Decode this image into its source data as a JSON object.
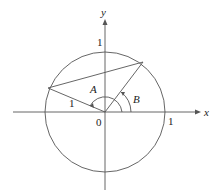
{
  "diagram": {
    "type": "unit-circle",
    "axes": {
      "x_label": "x",
      "y_label": "y"
    },
    "labels": {
      "origin": "0",
      "x_one": "1",
      "y_one": "1",
      "radius": "1",
      "angle_a": "A",
      "angle_b": "B"
    },
    "colors": {
      "stroke": "#555555",
      "text": "#222222",
      "background": "#ffffff"
    }
  }
}
